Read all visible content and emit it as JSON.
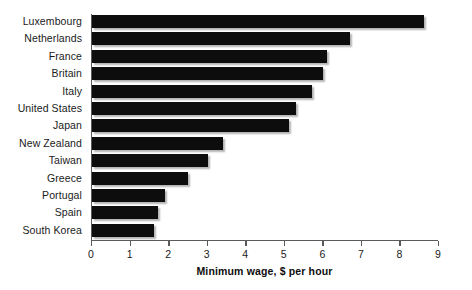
{
  "chart_data": {
    "type": "bar",
    "orientation": "horizontal",
    "title": "",
    "xlabel": "Minimum wage, $ per hour",
    "ylabel": "",
    "xlim": [
      0,
      9
    ],
    "xticks": [
      "0",
      "1",
      "2",
      "3",
      "4",
      "5",
      "6",
      "7",
      "8",
      "9"
    ],
    "grid": false,
    "legend": false,
    "bar_color": "#0d0d0d",
    "axis_color": "#5a5a5a",
    "categories": [
      "Luxembourg",
      "Netherlands",
      "France",
      "Britain",
      "Italy",
      "United States",
      "Japan",
      "New Zealand",
      "Taiwan",
      "Greece",
      "Portugal",
      "Spain",
      "South Korea"
    ],
    "values": [
      8.6,
      6.7,
      6.1,
      6.0,
      5.7,
      5.3,
      5.1,
      3.4,
      3.0,
      2.5,
      1.9,
      1.7,
      1.6
    ]
  }
}
